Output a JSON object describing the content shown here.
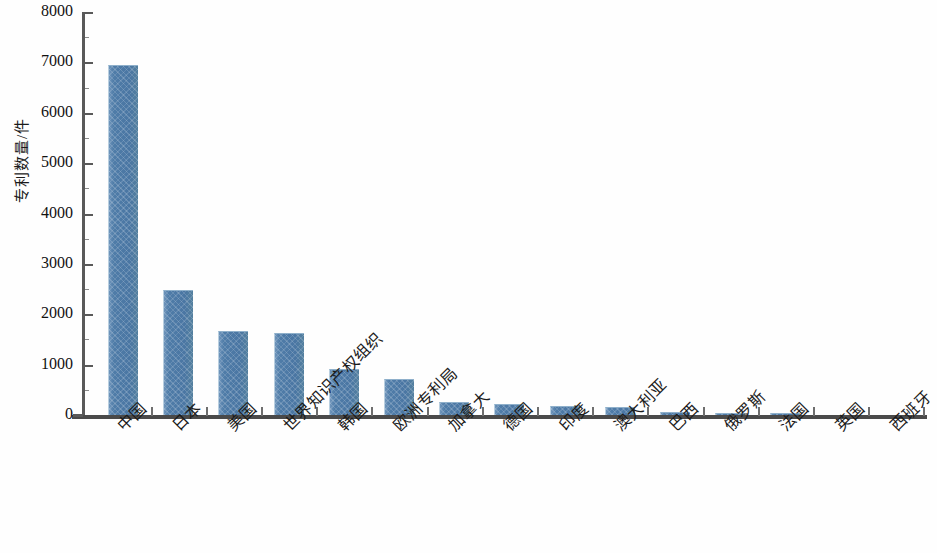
{
  "chart_data": {
    "type": "bar",
    "title": "",
    "subtitle": "",
    "xlabel": "",
    "ylabel": "专利数量/件",
    "ylim": [
      0,
      8000
    ],
    "ytick_step": 1000,
    "yticks": [
      "0",
      "1000",
      "2000",
      "3000",
      "4000",
      "5000",
      "6000",
      "7000",
      "8000"
    ],
    "grid": false,
    "legend": null,
    "bar_color": "#4F7CA8",
    "categories": [
      "中国",
      "日本",
      "美国",
      "世界知识产权组织",
      "韩国",
      "欧洲专利局",
      "加拿大",
      "德国",
      "印度",
      "澳大利亚",
      "巴西",
      "俄罗斯",
      "法国",
      "英国",
      "西班牙"
    ],
    "values": [
      6950,
      2480,
      1660,
      1620,
      920,
      710,
      260,
      215,
      185,
      165,
      60,
      45,
      40,
      8,
      5
    ]
  }
}
